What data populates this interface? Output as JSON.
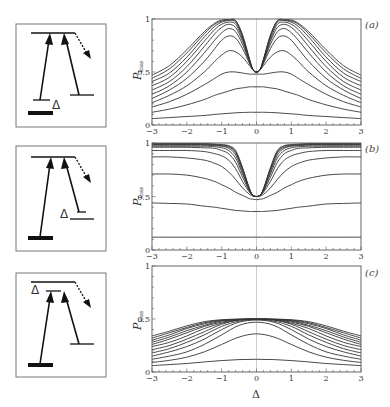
{
  "figure": {
    "xlabel": "Δ",
    "ylabel_main": "P",
    "ylabel_sub": "loss",
    "delta_symbol": "Δ"
  },
  "chart_data": [
    {
      "type": "line",
      "panel": "(a)",
      "title": "",
      "xlabel": "",
      "ylabel": "P_loss",
      "xlim": [
        -3,
        3
      ],
      "ylim": [
        0,
        1
      ],
      "xticks": [
        -3,
        -2,
        -1,
        0,
        1,
        2,
        3
      ],
      "yticks": [
        0,
        0.5,
        1
      ],
      "ytick_labels": [
        "0",
        "0.5",
        "1"
      ],
      "grid": false,
      "x": [
        -3,
        -2.5,
        -2,
        -1.5,
        -1.2,
        -1,
        -0.8,
        -0.6,
        -0.4,
        -0.2,
        -0.1,
        0,
        0.1,
        0.2,
        0.4,
        0.6,
        0.8,
        1,
        1.2,
        1.5,
        2,
        2.5,
        3
      ],
      "series": [
        {
          "name": "curve1",
          "values": [
            0.06,
            0.07,
            0.08,
            0.09,
            0.1,
            0.105,
            0.11,
            0.115,
            0.118,
            0.12,
            0.12,
            0.12,
            0.12,
            0.12,
            0.118,
            0.115,
            0.11,
            0.105,
            0.1,
            0.09,
            0.08,
            0.07,
            0.06
          ]
        },
        {
          "name": "curve2",
          "values": [
            0.12,
            0.15,
            0.19,
            0.24,
            0.28,
            0.3,
            0.32,
            0.34,
            0.35,
            0.36,
            0.36,
            0.36,
            0.36,
            0.36,
            0.35,
            0.34,
            0.32,
            0.3,
            0.28,
            0.24,
            0.19,
            0.15,
            0.12
          ]
        },
        {
          "name": "curve3",
          "values": [
            0.17,
            0.22,
            0.29,
            0.38,
            0.44,
            0.48,
            0.5,
            0.5,
            0.49,
            0.48,
            0.48,
            0.48,
            0.48,
            0.48,
            0.49,
            0.5,
            0.5,
            0.48,
            0.44,
            0.38,
            0.29,
            0.22,
            0.17
          ]
        },
        {
          "name": "curve4",
          "values": [
            0.21,
            0.28,
            0.37,
            0.5,
            0.6,
            0.66,
            0.7,
            0.69,
            0.64,
            0.56,
            0.52,
            0.5,
            0.52,
            0.56,
            0.64,
            0.69,
            0.7,
            0.66,
            0.6,
            0.5,
            0.37,
            0.28,
            0.21
          ]
        },
        {
          "name": "curve5",
          "values": [
            0.25,
            0.33,
            0.44,
            0.6,
            0.72,
            0.8,
            0.84,
            0.82,
            0.72,
            0.58,
            0.52,
            0.5,
            0.52,
            0.58,
            0.72,
            0.82,
            0.84,
            0.8,
            0.72,
            0.6,
            0.44,
            0.33,
            0.25
          ]
        },
        {
          "name": "curve6",
          "values": [
            0.29,
            0.37,
            0.5,
            0.68,
            0.8,
            0.87,
            0.91,
            0.88,
            0.76,
            0.59,
            0.52,
            0.5,
            0.52,
            0.59,
            0.76,
            0.88,
            0.91,
            0.87,
            0.8,
            0.68,
            0.5,
            0.37,
            0.29
          ]
        },
        {
          "name": "curve7",
          "values": [
            0.33,
            0.41,
            0.55,
            0.74,
            0.86,
            0.92,
            0.95,
            0.92,
            0.79,
            0.6,
            0.52,
            0.5,
            0.52,
            0.6,
            0.79,
            0.92,
            0.95,
            0.92,
            0.86,
            0.74,
            0.55,
            0.41,
            0.33
          ]
        },
        {
          "name": "curve8",
          "values": [
            0.37,
            0.45,
            0.6,
            0.79,
            0.9,
            0.95,
            0.97,
            0.95,
            0.81,
            0.61,
            0.52,
            0.5,
            0.52,
            0.61,
            0.81,
            0.95,
            0.97,
            0.95,
            0.9,
            0.79,
            0.6,
            0.45,
            0.37
          ]
        },
        {
          "name": "curve9",
          "values": [
            0.41,
            0.49,
            0.64,
            0.83,
            0.93,
            0.97,
            0.985,
            0.97,
            0.83,
            0.61,
            0.52,
            0.5,
            0.52,
            0.61,
            0.83,
            0.97,
            0.985,
            0.97,
            0.93,
            0.83,
            0.64,
            0.49,
            0.41
          ]
        },
        {
          "name": "curve10",
          "values": [
            0.44,
            0.53,
            0.68,
            0.86,
            0.95,
            0.98,
            0.99,
            0.98,
            0.84,
            0.62,
            0.52,
            0.5,
            0.52,
            0.62,
            0.84,
            0.98,
            0.99,
            0.98,
            0.95,
            0.86,
            0.68,
            0.53,
            0.44
          ]
        },
        {
          "name": "curve11",
          "values": [
            0.47,
            0.56,
            0.71,
            0.88,
            0.96,
            0.99,
            0.995,
            0.985,
            0.85,
            0.62,
            0.52,
            0.5,
            0.52,
            0.62,
            0.85,
            0.985,
            0.995,
            0.99,
            0.96,
            0.88,
            0.71,
            0.56,
            0.47
          ]
        }
      ]
    },
    {
      "type": "line",
      "panel": "(b)",
      "title": "",
      "xlabel": "",
      "ylabel": "P_loss",
      "xlim": [
        -3,
        3
      ],
      "ylim": [
        0,
        1
      ],
      "xticks": [
        -3,
        -2,
        -1,
        0,
        1,
        2,
        3
      ],
      "yticks": [
        0,
        0.5,
        1
      ],
      "ytick_labels": [
        "0",
        "0.5",
        "1"
      ],
      "grid": false,
      "x": [
        -3,
        -2.5,
        -2,
        -1.5,
        -1.2,
        -1,
        -0.8,
        -0.6,
        -0.4,
        -0.2,
        -0.1,
        0,
        0.1,
        0.2,
        0.4,
        0.6,
        0.8,
        1,
        1.2,
        1.5,
        2,
        2.5,
        3
      ],
      "series": [
        {
          "name": "curve1",
          "values": [
            0.12,
            0.12,
            0.12,
            0.12,
            0.12,
            0.12,
            0.12,
            0.12,
            0.12,
            0.12,
            0.12,
            0.12,
            0.12,
            0.12,
            0.12,
            0.12,
            0.12,
            0.12,
            0.12,
            0.12,
            0.12,
            0.12,
            0.12
          ]
        },
        {
          "name": "curve2",
          "values": [
            0.44,
            0.435,
            0.43,
            0.41,
            0.4,
            0.39,
            0.38,
            0.37,
            0.365,
            0.36,
            0.36,
            0.36,
            0.36,
            0.36,
            0.365,
            0.37,
            0.38,
            0.39,
            0.4,
            0.41,
            0.43,
            0.435,
            0.44
          ]
        },
        {
          "name": "curve3",
          "values": [
            0.71,
            0.71,
            0.7,
            0.67,
            0.64,
            0.61,
            0.58,
            0.54,
            0.51,
            0.48,
            0.475,
            0.47,
            0.475,
            0.48,
            0.51,
            0.54,
            0.58,
            0.61,
            0.64,
            0.67,
            0.7,
            0.71,
            0.71
          ]
        },
        {
          "name": "curve4",
          "values": [
            0.87,
            0.87,
            0.86,
            0.84,
            0.81,
            0.78,
            0.73,
            0.66,
            0.58,
            0.52,
            0.505,
            0.5,
            0.505,
            0.52,
            0.58,
            0.66,
            0.73,
            0.78,
            0.81,
            0.84,
            0.86,
            0.87,
            0.87
          ]
        },
        {
          "name": "curve5",
          "values": [
            0.93,
            0.93,
            0.93,
            0.92,
            0.9,
            0.88,
            0.84,
            0.76,
            0.64,
            0.54,
            0.51,
            0.5,
            0.51,
            0.54,
            0.64,
            0.76,
            0.84,
            0.88,
            0.9,
            0.92,
            0.93,
            0.93,
            0.93
          ]
        },
        {
          "name": "curve6",
          "values": [
            0.96,
            0.96,
            0.96,
            0.955,
            0.95,
            0.93,
            0.9,
            0.82,
            0.68,
            0.55,
            0.51,
            0.5,
            0.51,
            0.55,
            0.68,
            0.82,
            0.9,
            0.93,
            0.95,
            0.955,
            0.96,
            0.96,
            0.96
          ]
        },
        {
          "name": "curve7",
          "values": [
            0.97,
            0.97,
            0.97,
            0.97,
            0.965,
            0.955,
            0.93,
            0.86,
            0.71,
            0.56,
            0.51,
            0.5,
            0.51,
            0.56,
            0.71,
            0.86,
            0.93,
            0.955,
            0.965,
            0.97,
            0.97,
            0.97,
            0.97
          ]
        },
        {
          "name": "curve8",
          "values": [
            0.98,
            0.98,
            0.98,
            0.98,
            0.975,
            0.97,
            0.95,
            0.89,
            0.73,
            0.56,
            0.51,
            0.5,
            0.51,
            0.56,
            0.73,
            0.89,
            0.95,
            0.97,
            0.975,
            0.98,
            0.98,
            0.98,
            0.98
          ]
        },
        {
          "name": "curve9",
          "values": [
            0.985,
            0.985,
            0.985,
            0.985,
            0.98,
            0.975,
            0.96,
            0.91,
            0.75,
            0.57,
            0.51,
            0.5,
            0.51,
            0.57,
            0.75,
            0.91,
            0.96,
            0.975,
            0.98,
            0.985,
            0.985,
            0.985,
            0.985
          ]
        },
        {
          "name": "curve10",
          "values": [
            0.99,
            0.99,
            0.99,
            0.99,
            0.985,
            0.98,
            0.97,
            0.92,
            0.76,
            0.57,
            0.51,
            0.5,
            0.51,
            0.57,
            0.76,
            0.92,
            0.97,
            0.98,
            0.985,
            0.99,
            0.99,
            0.99,
            0.99
          ]
        },
        {
          "name": "curve11",
          "values": [
            0.995,
            0.995,
            0.995,
            0.995,
            0.99,
            0.985,
            0.975,
            0.93,
            0.77,
            0.57,
            0.51,
            0.5,
            0.51,
            0.57,
            0.77,
            0.93,
            0.975,
            0.985,
            0.99,
            0.995,
            0.995,
            0.995,
            0.995
          ]
        }
      ]
    },
    {
      "type": "line",
      "panel": "(c)",
      "title": "",
      "xlabel": "Δ",
      "ylabel": "P_loss",
      "xlim": [
        -3,
        3
      ],
      "ylim": [
        0,
        1
      ],
      "xticks": [
        -3,
        -2,
        -1,
        0,
        1,
        2,
        3
      ],
      "yticks": [
        0,
        0.5,
        1
      ],
      "ytick_labels": [
        "0",
        "0.5",
        "1"
      ],
      "grid": false,
      "x": [
        -3,
        -2.5,
        -2,
        -1.5,
        -1,
        -0.5,
        0,
        0.5,
        1,
        1.5,
        2,
        2.5,
        3
      ],
      "series": [
        {
          "name": "curve1",
          "values": [
            0.06,
            0.07,
            0.08,
            0.095,
            0.108,
            0.117,
            0.12,
            0.117,
            0.108,
            0.095,
            0.08,
            0.07,
            0.06
          ]
        },
        {
          "name": "curve2",
          "values": [
            0.09,
            0.11,
            0.14,
            0.19,
            0.26,
            0.33,
            0.36,
            0.33,
            0.26,
            0.19,
            0.14,
            0.11,
            0.09
          ]
        },
        {
          "name": "curve3",
          "values": [
            0.12,
            0.15,
            0.19,
            0.26,
            0.35,
            0.44,
            0.47,
            0.44,
            0.35,
            0.26,
            0.19,
            0.15,
            0.12
          ]
        },
        {
          "name": "curve4",
          "values": [
            0.15,
            0.19,
            0.24,
            0.31,
            0.4,
            0.47,
            0.49,
            0.47,
            0.4,
            0.31,
            0.24,
            0.19,
            0.15
          ]
        },
        {
          "name": "curve5",
          "values": [
            0.18,
            0.22,
            0.28,
            0.35,
            0.43,
            0.48,
            0.495,
            0.48,
            0.43,
            0.35,
            0.28,
            0.22,
            0.18
          ]
        },
        {
          "name": "curve6",
          "values": [
            0.21,
            0.25,
            0.31,
            0.38,
            0.45,
            0.49,
            0.497,
            0.49,
            0.45,
            0.38,
            0.31,
            0.25,
            0.21
          ]
        },
        {
          "name": "curve7",
          "values": [
            0.24,
            0.28,
            0.34,
            0.41,
            0.46,
            0.492,
            0.498,
            0.492,
            0.46,
            0.41,
            0.34,
            0.28,
            0.24
          ]
        },
        {
          "name": "curve8",
          "values": [
            0.26,
            0.31,
            0.37,
            0.43,
            0.47,
            0.494,
            0.499,
            0.494,
            0.47,
            0.43,
            0.37,
            0.31,
            0.26
          ]
        },
        {
          "name": "curve9",
          "values": [
            0.28,
            0.33,
            0.39,
            0.44,
            0.48,
            0.495,
            0.5,
            0.495,
            0.48,
            0.44,
            0.39,
            0.33,
            0.28
          ]
        },
        {
          "name": "curve10",
          "values": [
            0.3,
            0.35,
            0.41,
            0.455,
            0.485,
            0.497,
            0.5,
            0.497,
            0.485,
            0.455,
            0.41,
            0.35,
            0.3
          ]
        },
        {
          "name": "curve11",
          "values": [
            0.32,
            0.37,
            0.42,
            0.465,
            0.49,
            0.498,
            0.5,
            0.498,
            0.49,
            0.465,
            0.42,
            0.37,
            0.32
          ]
        },
        {
          "name": "curve12",
          "values": [
            0.34,
            0.385,
            0.435,
            0.475,
            0.493,
            0.499,
            0.5,
            0.499,
            0.493,
            0.475,
            0.435,
            0.385,
            0.34
          ]
        }
      ]
    }
  ],
  "panels": [
    {
      "label": "(a)",
      "frame": {
        "x0": 152,
        "x1": 361,
        "y_top": 19,
        "y_bottom": 125
      },
      "label_pos": [
        365,
        28
      ]
    },
    {
      "label": "(b)",
      "frame": {
        "x0": 152,
        "x1": 361,
        "y_top": 143,
        "y_bottom": 250
      },
      "label_pos": [
        365,
        152
      ]
    },
    {
      "label": "(c)",
      "frame": {
        "x0": 152,
        "x1": 361,
        "y_top": 266,
        "y_bottom": 372
      },
      "label_pos": [
        365,
        276
      ]
    }
  ],
  "colors": {
    "curve": "#333333",
    "frame": "#555555",
    "center_line": "#bbbbbb",
    "diagram": "#111111"
  }
}
